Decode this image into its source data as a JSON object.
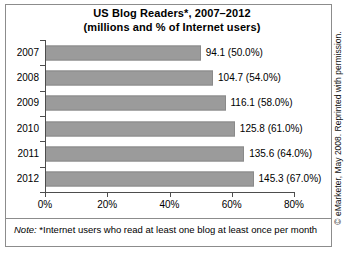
{
  "chart_data": {
    "type": "bar",
    "orientation": "horizontal",
    "title": "US Blog Readers*, 2007–2012",
    "subtitle": "(millions and % of Internet users)",
    "categories": [
      "2007",
      "2008",
      "2009",
      "2010",
      "2011",
      "2012"
    ],
    "values": [
      50.0,
      54.0,
      58.0,
      61.0,
      64.0,
      67.0
    ],
    "millions": [
      94.1,
      104.7,
      116.1,
      125.8,
      135.6,
      145.3
    ],
    "point_labels": [
      "94.1 (50.0%)",
      "104.7 (54.0%)",
      "116.1 (58.0%)",
      "125.8 (61.0%)",
      "135.6 (64.0%)",
      "145.3 (67.0%)"
    ],
    "xlabel": "",
    "ylabel": "",
    "xlim": [
      0,
      80
    ],
    "xticks": [
      "0%",
      "20%",
      "40%",
      "60%",
      "80%"
    ],
    "xtick_values": [
      0,
      20,
      40,
      60,
      80
    ],
    "grid": false,
    "legend": false,
    "bar_color": "#9b9b9b",
    "bar_border_color": "#8a8a8a",
    "axis_color": "#4d4d4d",
    "frame_color": "#8c8c8c",
    "background": "#ffffff"
  },
  "note": {
    "prefix": "Note:",
    "text": "*Internet users who read at least one blog at least once per month"
  },
  "credit": {
    "text": "© eMarketer, May 2008. Reprinted with permission."
  }
}
